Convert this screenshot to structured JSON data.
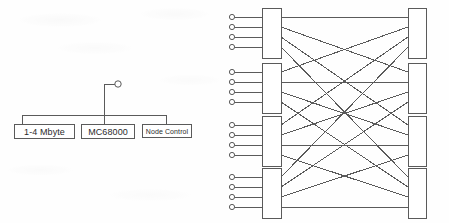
{
  "figure": {
    "background_color": "#fefefe",
    "line_color": "#5a5a5a",
    "text_color": "#2b2b2b"
  },
  "node_diagram": {
    "name": "node-block-diagram",
    "bus": {
      "label": "",
      "x1": 22,
      "x2": 166,
      "y": 115
    },
    "external_port": {
      "name": "external-link-port",
      "cx": 118,
      "cy": 84,
      "r": 3.2,
      "stub_from_x": 104,
      "stub_from_y": 84,
      "riser_x": 104,
      "riser_y_bottom": 124
    },
    "boxes": [
      {
        "id": "memory",
        "label": "1-4 Mbyte",
        "x": 14,
        "y": 124,
        "w": 61,
        "h": 15,
        "font_size": 9,
        "drop_x": 22
      },
      {
        "id": "cpu",
        "label": "MC68000",
        "x": 81,
        "y": 124,
        "w": 54,
        "h": 15,
        "font_size": 9,
        "drop_x": 104
      },
      {
        "id": "node_ctrl",
        "label": "Node Control",
        "x": 142,
        "y": 124,
        "w": 50,
        "h": 14,
        "font_size": 7,
        "drop_x": 166
      }
    ]
  },
  "network_diagram": {
    "name": "interconnection-network",
    "type": "two-stage-crossbar",
    "input_switch_count": 4,
    "output_switch_count": 4,
    "inputs_per_switch": 4,
    "total_inputs": 16,
    "total_links": 16,
    "terminal_marker": "open-circle",
    "terminal_radius": 2.6,
    "input_terminal_x": 7,
    "left_switch_x": 37,
    "left_switch_w": 19,
    "right_switch_x": 183,
    "right_switch_w": 18,
    "switch_height": 50,
    "switch_tops": [
      8,
      63,
      116,
      168
    ],
    "port_offsets": [
      9,
      19,
      29,
      39
    ],
    "connections": [
      {
        "from_switch": 0,
        "from_port": 0,
        "to_switch": 0
      },
      {
        "from_switch": 0,
        "from_port": 1,
        "to_switch": 1
      },
      {
        "from_switch": 0,
        "from_port": 2,
        "to_switch": 2
      },
      {
        "from_switch": 0,
        "from_port": 3,
        "to_switch": 3
      },
      {
        "from_switch": 1,
        "from_port": 0,
        "to_switch": 0
      },
      {
        "from_switch": 1,
        "from_port": 1,
        "to_switch": 1
      },
      {
        "from_switch": 1,
        "from_port": 2,
        "to_switch": 2
      },
      {
        "from_switch": 1,
        "from_port": 3,
        "to_switch": 3
      },
      {
        "from_switch": 2,
        "from_port": 0,
        "to_switch": 0
      },
      {
        "from_switch": 2,
        "from_port": 1,
        "to_switch": 1
      },
      {
        "from_switch": 2,
        "from_port": 2,
        "to_switch": 2
      },
      {
        "from_switch": 2,
        "from_port": 3,
        "to_switch": 3
      },
      {
        "from_switch": 3,
        "from_port": 0,
        "to_switch": 0
      },
      {
        "from_switch": 3,
        "from_port": 1,
        "to_switch": 1
      },
      {
        "from_switch": 3,
        "from_port": 2,
        "to_switch": 2
      },
      {
        "from_switch": 3,
        "from_port": 3,
        "to_switch": 3
      }
    ]
  }
}
